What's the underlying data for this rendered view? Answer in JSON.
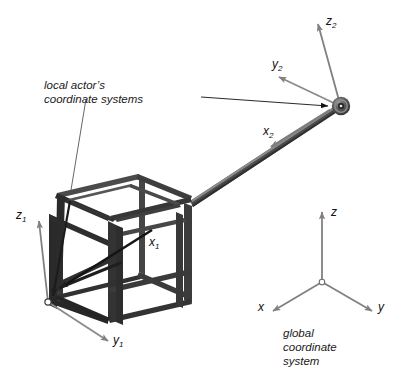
{
  "diagram": {
    "type": "3d-technical-illustration",
    "background_color": "#ffffff"
  },
  "colors": {
    "axis_gray": "#808080",
    "axis_gray_dark": "#6e6e6e",
    "cube_dark": "#2b2b2b",
    "cube_mid": "#3d3d3d",
    "cube_light": "#555555",
    "rod_dark": "#4a4a4a",
    "rod_light": "#7a7a7a",
    "joint_dark": "#3a3a3a",
    "joint_ring": "#9a9a9a",
    "leader_line": "#555555",
    "text": "#111111"
  },
  "callouts": {
    "local": {
      "line1": "local actor’s",
      "line2": "coordinate systems"
    },
    "global": {
      "line1": "global",
      "line2": "coordinate",
      "line3": "system"
    }
  },
  "local_frame_1": {
    "name": "actor-cube-frame",
    "origin_label": "o",
    "axes": [
      {
        "name": "x1",
        "letter": "x",
        "subscript": "1",
        "label": "x₁",
        "direction": "into-cube-lower-left"
      },
      {
        "name": "y1",
        "letter": "y",
        "subscript": "1",
        "label": "y₁",
        "direction": "lower-right"
      },
      {
        "name": "z1",
        "letter": "z",
        "subscript": "1",
        "label": "z₁",
        "direction": "upper-left"
      }
    ]
  },
  "local_frame_2": {
    "name": "joint-frame",
    "origin_label": "o",
    "axes": [
      {
        "name": "x2",
        "letter": "x",
        "subscript": "2",
        "label": "x₂",
        "direction": "lower-left-along-rod"
      },
      {
        "name": "y2",
        "letter": "y",
        "subscript": "2",
        "label": "y₂",
        "direction": "upper-left"
      },
      {
        "name": "z2",
        "letter": "z",
        "subscript": "2",
        "label": "z₂",
        "direction": "up"
      }
    ]
  },
  "global_frame": {
    "name": "global-frame",
    "origin_label": "o",
    "axes": [
      {
        "name": "x",
        "letter": "x",
        "subscript": "",
        "label": "x",
        "direction": "lower-left"
      },
      {
        "name": "y",
        "letter": "y",
        "subscript": "",
        "label": "y",
        "direction": "lower-right"
      },
      {
        "name": "z",
        "letter": "z",
        "subscript": "",
        "label": "z",
        "direction": "up"
      }
    ]
  },
  "objects": {
    "cube": {
      "name": "wireframe-cube",
      "description": "open box frame of thick struts"
    },
    "rod": {
      "name": "connecting-rod",
      "description": "straight beam from cube to ball joint"
    },
    "joint": {
      "name": "ball-joint",
      "description": "spherical joint with concentric rings"
    }
  }
}
